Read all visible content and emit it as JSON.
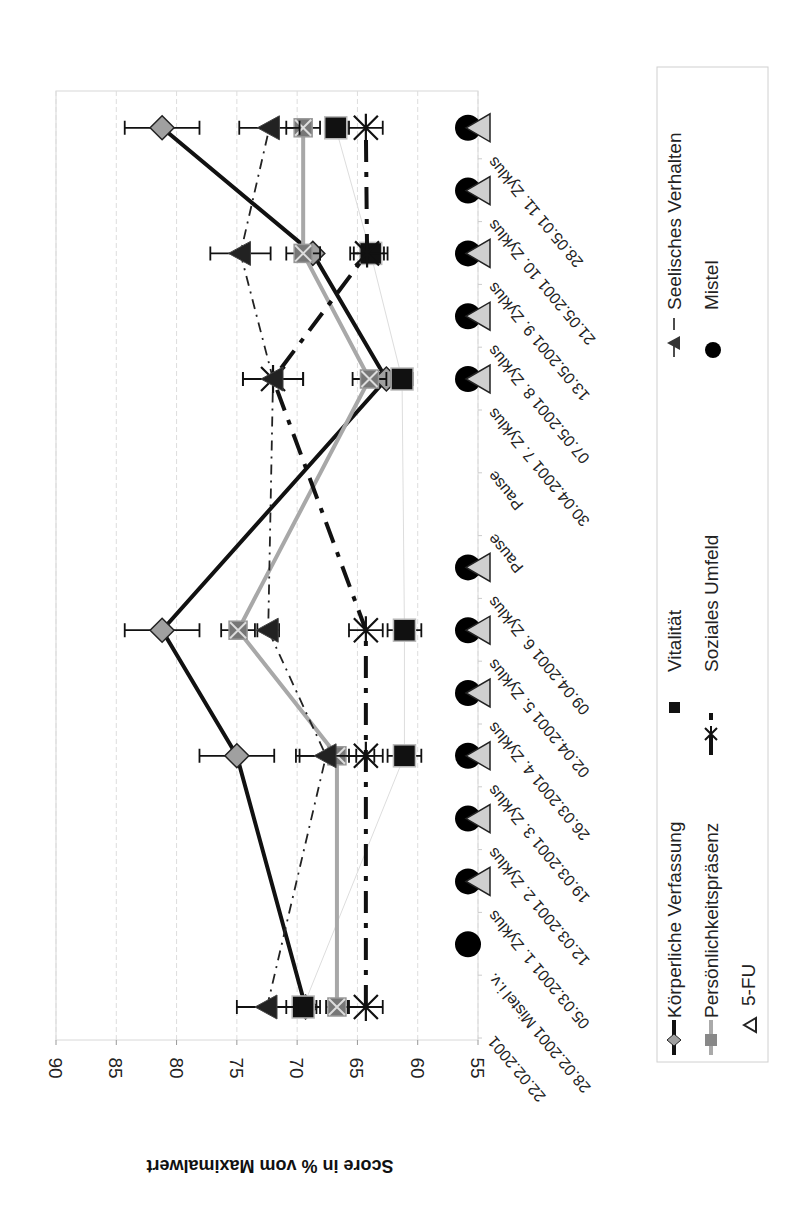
{
  "chart_data": {
    "type": "line",
    "orientation_note": "figure rotated 90 degrees clockwise",
    "title": "",
    "xlabel": "",
    "ylabel": "Score in % vom Maximalwert",
    "ylim": [
      55,
      90
    ],
    "yticks": [
      90,
      85,
      80,
      75,
      70,
      65,
      60,
      55
    ],
    "grid": true,
    "legend_position": "bottom",
    "categories": [
      "22.02.2001",
      "28.02.2001 Mistel i.v.",
      "05.03.2001 1. Zyklus",
      "12.03.2001 2. Zyklus",
      "19.03.2001 3. Zyklus",
      "26.03.2001 4. Zyklus",
      "02.04.2001 5. Zyklus",
      "09.04.2001 6. Zyklus",
      "Pause",
      "Pause",
      "30.04.2001 7. Zyklus",
      "07.05.2001 8. Zyklus",
      "13.05.2001 9. Zyklus",
      "21.05.2001 10. Zyklus",
      "28.05.01 11. Zyklus"
    ],
    "series": [
      {
        "name": "Körperliche Verfassung",
        "marker": "diamond",
        "line": "solid-black",
        "values": [
          69.3,
          null,
          null,
          null,
          75.0,
          null,
          81.2,
          null,
          null,
          null,
          62.6,
          null,
          68.7,
          null,
          81.2
        ],
        "error": [
          0.9,
          null,
          null,
          null,
          3.1,
          null,
          3.1,
          null,
          null,
          null,
          0.6,
          null,
          0.6,
          null,
          3.1
        ]
      },
      {
        "name": "Vitalität",
        "marker": "square",
        "line": "thin-gray",
        "values": [
          69.5,
          null,
          null,
          null,
          61.1,
          null,
          61.1,
          null,
          null,
          null,
          61.3,
          null,
          63.9,
          null,
          66.8
        ],
        "error": [
          1.4,
          null,
          null,
          null,
          1.4,
          null,
          1.4,
          null,
          null,
          null,
          0.9,
          null,
          1.4,
          null,
          0.9
        ]
      },
      {
        "name": "Persönlichkeitspräsenz",
        "marker": "x-square",
        "line": "solid-gray",
        "values": [
          66.7,
          null,
          null,
          null,
          66.7,
          null,
          74.9,
          null,
          null,
          null,
          64.0,
          null,
          69.5,
          null,
          69.5
        ],
        "error": [
          0.9,
          null,
          null,
          null,
          3.1,
          null,
          1.4,
          null,
          null,
          null,
          1.4,
          null,
          1.4,
          null,
          1.4
        ]
      },
      {
        "name": "Soziales Umfeld",
        "marker": "star",
        "line": "dash-dot-black",
        "values": [
          64.3,
          null,
          null,
          null,
          64.3,
          null,
          64.3,
          null,
          null,
          null,
          72.0,
          null,
          64.2,
          null,
          64.3
        ],
        "error": [
          1.4,
          null,
          null,
          null,
          1.4,
          null,
          1.4,
          null,
          null,
          null,
          2.5,
          null,
          1.4,
          null,
          1.4
        ]
      },
      {
        "name": "Seelisches Verhalten",
        "marker": "triangle",
        "line": "dash-dot-thin",
        "values": [
          72.5,
          null,
          null,
          null,
          67.6,
          null,
          72.4,
          null,
          null,
          null,
          72.0,
          null,
          74.7,
          null,
          72.3
        ],
        "error": [
          2.5,
          null,
          null,
          null,
          2.5,
          null,
          0.9,
          null,
          null,
          null,
          2.5,
          null,
          2.5,
          null,
          2.5
        ]
      }
    ],
    "events": {
      "Mistel": [
        false,
        true,
        true,
        true,
        true,
        true,
        true,
        true,
        false,
        false,
        true,
        true,
        true,
        true,
        true
      ],
      "5-FU": [
        false,
        false,
        true,
        true,
        true,
        true,
        true,
        true,
        false,
        false,
        true,
        true,
        true,
        true,
        true
      ],
      "event_value": 55
    },
    "legend": [
      {
        "label": "Körperliche Verfassung",
        "symbol": "diamond-line"
      },
      {
        "label": "Vitalität",
        "symbol": "square"
      },
      {
        "label": "Seelisches Verhalten",
        "symbol": "triangle-dashdot"
      },
      {
        "label": "Persönlichkeitspräsenz",
        "symbol": "xsquare-line"
      },
      {
        "label": "Soziales Umfeld",
        "symbol": "star-dashdot"
      },
      {
        "label": "Mistel",
        "symbol": "circle"
      },
      {
        "label": "5-FU",
        "symbol": "open-triangle"
      }
    ]
  },
  "colors": {
    "koerperlich_line": "#111111",
    "koerperlich_marker": "#a0a0a0",
    "persoenlich_line": "#a8a8a8",
    "persoenlich_marker": "#777777",
    "vitalitaet": "#111111",
    "sozial": "#111111",
    "seelisch": "#222222",
    "mistel": "#000000",
    "fu": "#cfcfcf",
    "grid": "#dddddd"
  }
}
